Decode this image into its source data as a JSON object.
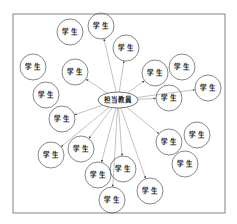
{
  "diagram": {
    "frame": {
      "x": 13,
      "y": 14,
      "w": 212,
      "h": 199,
      "stroke": "#666666"
    },
    "center": {
      "label": "担当教員",
      "cx": 118,
      "cy": 100,
      "rx": 20,
      "ry": 8
    },
    "student_label": "学 生",
    "students": [
      {
        "cx": 70,
        "cy": 32,
        "connected": false
      },
      {
        "cx": 101,
        "cy": 26,
        "connected": true
      },
      {
        "cx": 126,
        "cy": 48,
        "connected": true
      },
      {
        "cx": 33,
        "cy": 67,
        "connected": false
      },
      {
        "cx": 75,
        "cy": 72,
        "connected": true
      },
      {
        "cx": 155,
        "cy": 73,
        "connected": true
      },
      {
        "cx": 182,
        "cy": 67,
        "connected": false
      },
      {
        "cx": 208,
        "cy": 88,
        "connected": true
      },
      {
        "cx": 169,
        "cy": 98,
        "connected": true
      },
      {
        "cx": 46,
        "cy": 95,
        "connected": false
      },
      {
        "cx": 62,
        "cy": 119,
        "connected": true
      },
      {
        "cx": 169,
        "cy": 142,
        "connected": true
      },
      {
        "cx": 197,
        "cy": 135,
        "connected": false
      },
      {
        "cx": 185,
        "cy": 164,
        "connected": false
      },
      {
        "cx": 51,
        "cy": 155,
        "connected": true
      },
      {
        "cx": 81,
        "cy": 149,
        "connected": true
      },
      {
        "cx": 98,
        "cy": 175,
        "connected": true
      },
      {
        "cx": 123,
        "cy": 169,
        "connected": true
      },
      {
        "cx": 112,
        "cy": 200,
        "connected": true
      },
      {
        "cx": 150,
        "cy": 191,
        "connected": true
      }
    ],
    "student_rx": 13,
    "student_ry": 13,
    "line_color": "#999999",
    "stroke_color": "#555555"
  }
}
